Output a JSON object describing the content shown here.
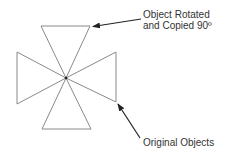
{
  "diagram": {
    "labels": {
      "rotated_line1": "Object Rotated",
      "rotated_line2": "and Copied 90º",
      "original": "Original Objects"
    },
    "center": [
      66,
      78
    ],
    "triangles": {
      "rotated_copy": [
        [
          [
            66,
            78
          ],
          [
            41,
            26
          ],
          [
            90,
            26
          ]
        ],
        [
          [
            66,
            78
          ],
          [
            42,
            129
          ],
          [
            91,
            129
          ]
        ]
      ],
      "original": [
        [
          [
            66,
            78
          ],
          [
            17,
            52
          ],
          [
            17,
            104
          ]
        ],
        [
          [
            66,
            78
          ],
          [
            116,
            52
          ],
          [
            116,
            102
          ]
        ]
      ]
    },
    "colors": {
      "stroke": "#8a8a8a",
      "arrow": "#222222",
      "text": "#333333"
    }
  }
}
